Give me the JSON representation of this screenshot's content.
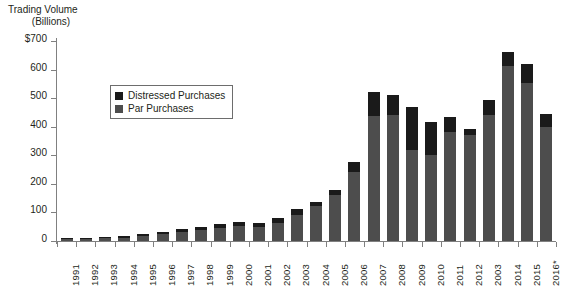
{
  "chart_data": {
    "type": "bar",
    "stacked": true,
    "title": "Trading Volume",
    "subtitle": "(Billions)",
    "xlabel": "",
    "ylabel": "",
    "ylim": [
      0,
      700
    ],
    "ytick_values": [
      700,
      600,
      500,
      400,
      300,
      200,
      100,
      0
    ],
    "ytick_labels": [
      "$700",
      "600",
      "500",
      "400",
      "300",
      "200",
      "100",
      "0"
    ],
    "grid": false,
    "legend_position": "inside-upper-left",
    "categories": [
      "1991",
      "1992",
      "1993",
      "1994",
      "1995",
      "1996",
      "1997",
      "1998",
      "1999",
      "2000",
      "2001",
      "2002",
      "2003",
      "2004",
      "2005",
      "2006",
      "2007",
      "2008",
      "2009",
      "2010",
      "2011",
      "2012",
      "2003",
      "2014",
      "2015",
      "2016*"
    ],
    "series": [
      {
        "name": "Par Purchases",
        "color": "#4d4d4d",
        "values": [
          6,
          8,
          10,
          11,
          18,
          24,
          33,
          38,
          47,
          52,
          48,
          62,
          92,
          122,
          160,
          240,
          437,
          440,
          318,
          300,
          382,
          372,
          440,
          613,
          552,
          400
        ]
      },
      {
        "name": "Distressed Purchases",
        "color": "#1a1a1a",
        "values": [
          4,
          4,
          5,
          5,
          6,
          6,
          9,
          10,
          13,
          16,
          16,
          18,
          20,
          16,
          20,
          38,
          86,
          70,
          152,
          118,
          52,
          20,
          53,
          49,
          68,
          45
        ]
      }
    ],
    "totals": [
      10,
      12,
      15,
      16,
      24,
      30,
      42,
      48,
      60,
      68,
      64,
      80,
      112,
      138,
      180,
      278,
      523,
      510,
      470,
      418,
      434,
      392,
      493,
      662,
      620,
      445
    ],
    "footnote_marker": "*"
  },
  "legend": {
    "items": [
      {
        "label": "Distressed Purchases",
        "color": "#1a1a1a"
      },
      {
        "label": "Par Purchases",
        "color": "#4d4d4d"
      }
    ]
  }
}
